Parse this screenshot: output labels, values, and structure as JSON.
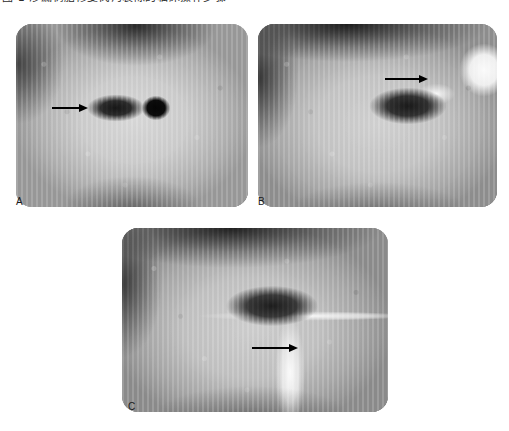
{
  "figure": {
    "caption_top": "图 1 渗漏树脂修复窝沟裂隙的临床操作步骤",
    "background_color": "#ffffff",
    "annotation_color": "#000000",
    "width": 509,
    "height": 431
  },
  "panels": [
    {
      "id": "panel-a",
      "label": "A",
      "modality": "clinical-photograph",
      "view": "occlusal",
      "subject": "molar-tooth-with-prepared-cavity",
      "label_x": 16,
      "label_y": 198,
      "x": 16,
      "y": 24,
      "width": 232,
      "height": 183,
      "arrow": {
        "x": 52,
        "y": 108,
        "length": 36,
        "direction": "right",
        "points_to": "carious-fissure-lesion"
      }
    },
    {
      "id": "panel-b",
      "label": "B",
      "modality": "clinical-photograph",
      "view": "occlusal",
      "subject": "tooth-with-applied-material-and-instrument",
      "label_x": 258,
      "label_y": 198,
      "x": 258,
      "y": 24,
      "width": 239,
      "height": 183,
      "arrow": {
        "x": 385,
        "y": 79,
        "length": 43,
        "direction": "right",
        "points_to": "resin-applied-to-fissure"
      }
    },
    {
      "id": "panel-c",
      "label": "C",
      "modality": "clinical-photograph",
      "view": "occlusal",
      "subject": "tooth-with-sealant-and-dispensing-tip",
      "label_x": 128,
      "label_y": 403,
      "x": 122,
      "y": 228,
      "width": 266,
      "height": 184,
      "arrow": {
        "x": 252,
        "y": 348,
        "length": 46,
        "direction": "right",
        "points_to": "sealant-material-flow"
      }
    }
  ]
}
